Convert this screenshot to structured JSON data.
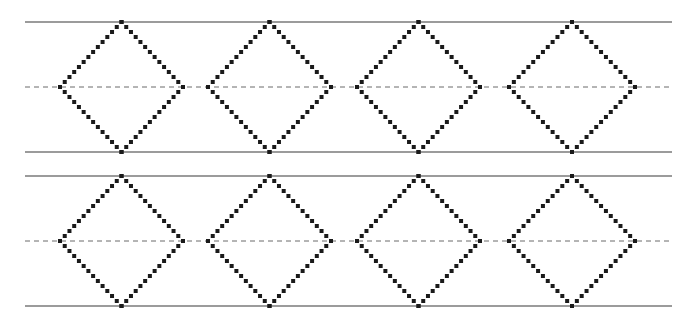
{
  "figure": {
    "title": "",
    "background_color": "#ffffff",
    "width": 687,
    "height": 328,
    "solid_line_color": "#7a7a7a",
    "dashed_center_line_color": "#6b6b6b",
    "diamond_dot_color": "#1a1a1a",
    "dot_size_px": 4,
    "dot_gap_px": 3
  },
  "chart_data": {
    "type": "diagram",
    "title": "",
    "subtitle": "",
    "xlabel": "",
    "ylabel": "",
    "xlim": [
      0,
      687
    ],
    "ylim": [
      0,
      328
    ],
    "grid": false,
    "legend": "none",
    "bands": [
      {
        "name": "band-1",
        "top_line_y": 22,
        "center_line_y": 87,
        "bottom_line_y": 152,
        "line_x_start": 25,
        "line_x_end": 672,
        "diamonds": [
          {
            "name": "diamond-1-1",
            "left_x": 60,
            "right_x": 183,
            "center_x": 121.5,
            "top_y": 22,
            "bottom_y": 152,
            "center_y": 87
          },
          {
            "name": "diamond-1-2",
            "left_x": 208,
            "right_x": 331,
            "center_x": 269.5,
            "top_y": 22,
            "bottom_y": 152,
            "center_y": 87
          },
          {
            "name": "diamond-1-3",
            "left_x": 357,
            "right_x": 480,
            "center_x": 418.5,
            "top_y": 22,
            "bottom_y": 152,
            "center_y": 87
          },
          {
            "name": "diamond-1-4",
            "left_x": 509,
            "right_x": 635,
            "center_x": 572.0,
            "top_y": 22,
            "bottom_y": 152,
            "center_y": 87
          }
        ]
      },
      {
        "name": "band-2",
        "top_line_y": 176,
        "center_line_y": 241,
        "bottom_line_y": 306,
        "line_x_start": 25,
        "line_x_end": 672,
        "diamonds": [
          {
            "name": "diamond-2-1",
            "left_x": 60,
            "right_x": 183,
            "center_x": 121.5,
            "top_y": 176,
            "bottom_y": 306,
            "center_y": 241
          },
          {
            "name": "diamond-2-2",
            "left_x": 208,
            "right_x": 331,
            "center_x": 269.5,
            "top_y": 176,
            "bottom_y": 306,
            "center_y": 241
          },
          {
            "name": "diamond-2-3",
            "left_x": 357,
            "right_x": 480,
            "center_x": 418.5,
            "top_y": 176,
            "bottom_y": 306,
            "center_y": 241
          },
          {
            "name": "diamond-2-4",
            "left_x": 509,
            "right_x": 635,
            "center_x": 572.0,
            "top_y": 176,
            "bottom_y": 306,
            "center_y": 241
          }
        ]
      }
    ],
    "counts": {
      "bands": 2,
      "diamonds_per_band": 4,
      "total_diamonds": 8,
      "solid_lines": 4,
      "dashed_lines": 2
    }
  }
}
